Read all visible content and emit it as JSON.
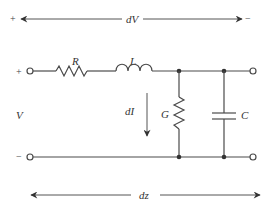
{
  "diagram": {
    "colors": {
      "line": "#4a4a4a",
      "text": "#333333",
      "background": "#ffffff"
    },
    "voltage_arrow": {
      "label": "dV",
      "left_sign": "+",
      "right_sign": "−"
    },
    "length_arrow": {
      "label": "dz"
    },
    "current_arrow": {
      "label": "dI"
    },
    "input": {
      "label": "V",
      "top_sign": "+",
      "bottom_sign": "−"
    },
    "components": [
      {
        "id": "R",
        "label": "R",
        "type": "series-resistor"
      },
      {
        "id": "L",
        "label": "L",
        "type": "series-inductor"
      },
      {
        "id": "G",
        "label": "G",
        "type": "shunt-conductance"
      },
      {
        "id": "C",
        "label": "C",
        "type": "shunt-capacitor"
      }
    ]
  }
}
